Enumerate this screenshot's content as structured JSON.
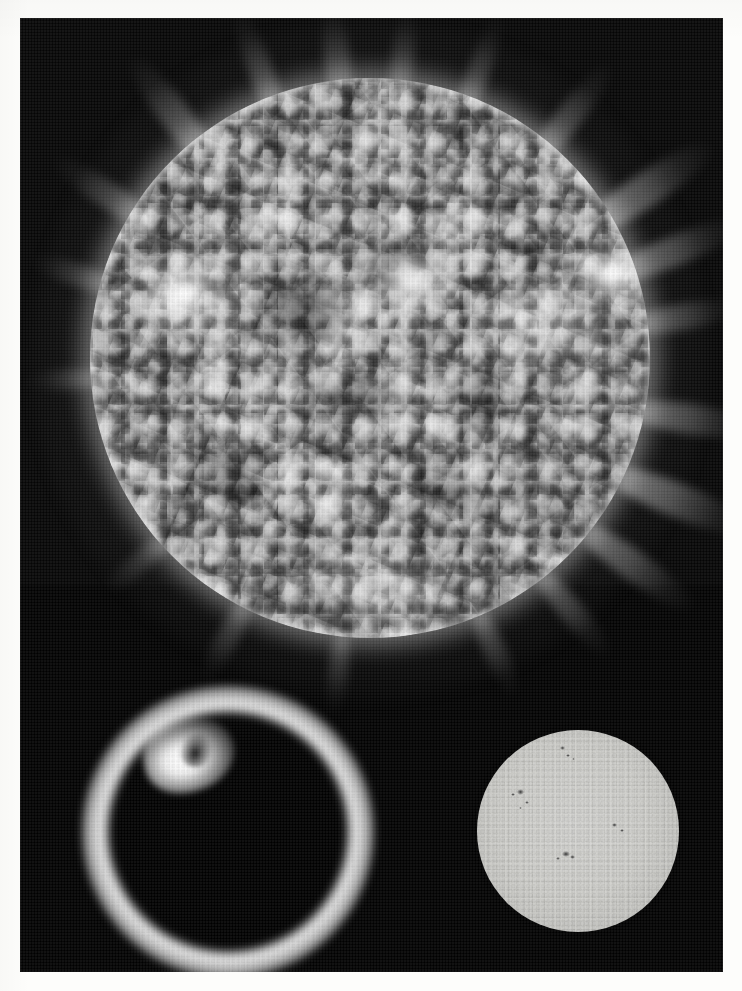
{
  "page": {
    "medium": "photographic print on white paper",
    "width": 742,
    "height": 991,
    "paper_color": "#fdfdfb",
    "plate_color": "#030303",
    "plate_bounds": {
      "left": 20,
      "top": 18,
      "width": 703,
      "height": 954
    }
  },
  "panels": [
    {
      "id": "corona-euv",
      "name": "Solar corona extreme-ultraviolet full disk",
      "position": "top",
      "disk": {
        "center_x": 350,
        "center_y": 340,
        "radius": 280,
        "body_color": "#7c7c7c",
        "limb_color": "#ffffff",
        "background_color": "#040404"
      },
      "features": {
        "coronal_streamers": 16,
        "bright_active_regions": 5,
        "dark_coronal_holes": 6
      }
    },
    {
      "id": "chromosphere-ring",
      "name": "Chromosphere ring with prominence",
      "position": "bottom-left",
      "disk": {
        "center_x": 208,
        "center_y": 814,
        "occulter_radius": 93,
        "ring_outer_radius": 146,
        "ring_color": "#ffffff",
        "occulter_color": "#000000"
      },
      "features": {
        "prominence_clock_position": "10 o'clock",
        "prominence_brightness": "saturated white"
      }
    },
    {
      "id": "photosphere-whitelight",
      "name": "Photosphere white-light full disk with sunspots",
      "position": "bottom-right",
      "disk": {
        "center_x": 558,
        "center_y": 813,
        "radius": 101,
        "body_color": "#cdcdc9",
        "limb_color": "#9a9a97",
        "background_color": "#010101"
      },
      "sunspots": [
        {
          "x": 0.41,
          "y": 0.08,
          "size": 5
        },
        {
          "x": 0.44,
          "y": 0.12,
          "size": 4
        },
        {
          "x": 0.47,
          "y": 0.14,
          "size": 3
        },
        {
          "x": 0.2,
          "y": 0.29,
          "size": 7
        },
        {
          "x": 0.17,
          "y": 0.31,
          "size": 4
        },
        {
          "x": 0.24,
          "y": 0.35,
          "size": 4
        },
        {
          "x": 0.21,
          "y": 0.38,
          "size": 3
        },
        {
          "x": 0.67,
          "y": 0.46,
          "size": 5
        },
        {
          "x": 0.71,
          "y": 0.49,
          "size": 4
        },
        {
          "x": 0.42,
          "y": 0.6,
          "size": 8
        },
        {
          "x": 0.46,
          "y": 0.62,
          "size": 5
        },
        {
          "x": 0.39,
          "y": 0.63,
          "size": 4
        }
      ]
    }
  ],
  "colors": {
    "paper": "#fdfdfb",
    "sky": "#030303",
    "corona_highlight": "#ffffff",
    "corona_body": "#7c7c7c",
    "photosphere": "#cdcdc9"
  }
}
